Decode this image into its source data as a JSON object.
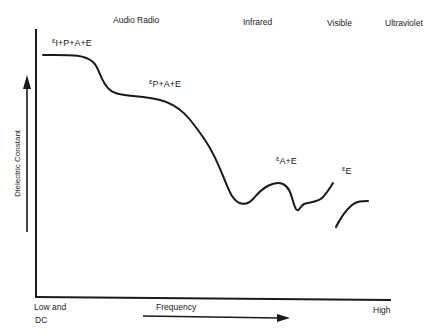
{
  "regions": [
    {
      "label": "Audio Radio"
    },
    {
      "label": "Infrared"
    },
    {
      "label": "Visible"
    },
    {
      "label": "Ultraviolet"
    }
  ],
  "curve_labels": {
    "i_p_a_e": {
      "symbol": "ε",
      "subscript": "I+P+A+E"
    },
    "p_a_e": {
      "symbol": "ε",
      "subscript": "P+A+E"
    },
    "a_e": {
      "symbol": "ε",
      "subscript": "A+E"
    },
    "e": {
      "symbol": "ε",
      "subscript": "E"
    }
  },
  "axes": {
    "y_label": "Dielectric Constant",
    "x_label": "Frequency",
    "x_low_line1": "Low and",
    "x_low_line2": "DC",
    "x_high": "High"
  },
  "colors": {
    "line": "#1a1a1a",
    "background": "#ffffff"
  }
}
